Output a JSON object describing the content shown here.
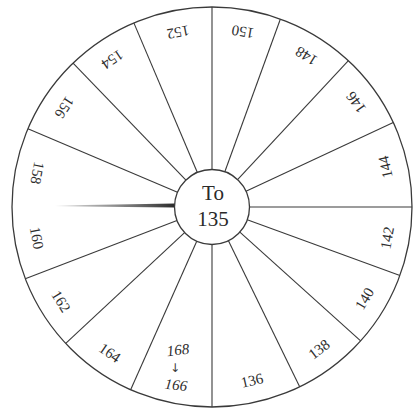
{
  "diagram": {
    "type": "circular-sector-dial",
    "center_label": {
      "line1": "To",
      "line2": "135"
    },
    "sectors": [
      {
        "label": "150",
        "mid_angle": 10
      },
      {
        "label": "148",
        "mid_angle": 32
      },
      {
        "label": "146",
        "mid_angle": 54
      },
      {
        "label": "144",
        "mid_angle": 77
      },
      {
        "label": "142",
        "mid_angle": 100
      },
      {
        "label": "140",
        "mid_angle": 121
      },
      {
        "label": "138",
        "mid_angle": 143
      },
      {
        "label": "136",
        "mid_angle": 167
      },
      {
        "label": "166",
        "mid_angle": 192
      },
      {
        "label": "164",
        "mid_angle": 215
      },
      {
        "label": "162",
        "mid_angle": 238
      },
      {
        "label": "160",
        "mid_angle": 260
      },
      {
        "label": "158",
        "mid_angle": 281
      },
      {
        "label": "156",
        "mid_angle": 304
      },
      {
        "label": "154",
        "mid_angle": 326
      },
      {
        "label": "152",
        "mid_angle": 349
      }
    ],
    "special_sector": {
      "from_label": "168",
      "arrow": "↓",
      "to_label": "166"
    },
    "spoke_angles": [
      0,
      20,
      43,
      65,
      90,
      110,
      132,
      154,
      180,
      204,
      227,
      249,
      293,
      316,
      337
    ],
    "start_marker_angle": 270,
    "colors": {
      "line": "#3a3a3a",
      "text": "#2e2e2e",
      "background": "#ffffff"
    }
  }
}
